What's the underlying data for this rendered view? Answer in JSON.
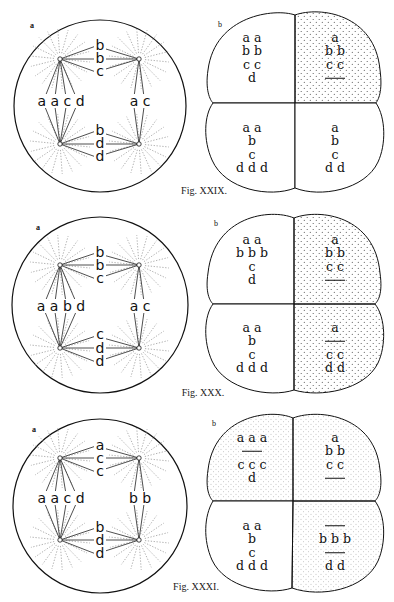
{
  "figures": [
    {
      "caption": "Fig. XXIX.",
      "panel_a": {
        "label": "a",
        "top_chromosomes": [
          "b",
          "b",
          "c"
        ],
        "bottom_chromosomes": [
          "b",
          "d",
          "d"
        ],
        "left_chromosomes": "a a c d",
        "right_chromosomes": "a c"
      },
      "panel_b": {
        "label": "b",
        "cells": [
          {
            "position": "top-left",
            "shaded": false,
            "lines": [
              "a a",
              "b b",
              "c c",
              "d"
            ],
            "bars": []
          },
          {
            "position": "top-right",
            "shaded": true,
            "lines": [
              "a",
              "b b",
              "c c"
            ],
            "bars": [
              "after-3"
            ]
          },
          {
            "position": "bottom-left",
            "shaded": false,
            "lines": [
              "a a",
              "b",
              "c",
              "d d d"
            ],
            "bars": []
          },
          {
            "position": "bottom-right",
            "shaded": false,
            "lines": [
              "a",
              "b",
              "c",
              "d d"
            ],
            "bars": []
          }
        ]
      }
    },
    {
      "caption": "Fig. XXX.",
      "panel_a": {
        "label": "a",
        "top_chromosomes": [
          "b",
          "b",
          "c"
        ],
        "bottom_chromosomes": [
          "c",
          "d",
          "d"
        ],
        "left_chromosomes": "a a b d",
        "right_chromosomes": "a c"
      },
      "panel_b": {
        "label": "b",
        "cells": [
          {
            "position": "top-left",
            "shaded": false,
            "lines": [
              "a a",
              "b b b",
              "c",
              "d"
            ],
            "bars": []
          },
          {
            "position": "top-right",
            "shaded": true,
            "lines": [
              "a",
              "b b",
              "c c"
            ],
            "bars": [
              "after-3"
            ]
          },
          {
            "position": "bottom-left",
            "shaded": false,
            "lines": [
              "a a",
              "b",
              "c",
              "d d d"
            ],
            "bars": []
          },
          {
            "position": "bottom-right",
            "shaded": true,
            "lines": [
              "a",
              "c c",
              "d d"
            ],
            "bars": [
              "after-1"
            ]
          }
        ]
      }
    },
    {
      "caption": "Fig. XXXI.",
      "panel_a": {
        "label": "a",
        "top_chromosomes": [
          "a",
          "c",
          "c"
        ],
        "bottom_chromosomes": [
          "b",
          "d",
          "d"
        ],
        "left_chromosomes": "a a c d",
        "right_chromosomes": "b b"
      },
      "panel_b": {
        "label": "b",
        "cells": [
          {
            "position": "top-left",
            "shaded": true,
            "lines": [
              "a a a",
              "c c c",
              "d"
            ],
            "bars": [
              "after-1"
            ]
          },
          {
            "position": "top-right",
            "shaded": true,
            "lines": [
              "a",
              "b b",
              "c c"
            ],
            "bars": [
              "after-3"
            ]
          },
          {
            "position": "bottom-left",
            "shaded": false,
            "lines": [
              "a a",
              "b",
              "c",
              "d d d"
            ],
            "bars": []
          },
          {
            "position": "bottom-right",
            "shaded": true,
            "lines": [
              "b b b",
              "d d"
            ],
            "bars": [
              "before-1",
              "after-1"
            ]
          }
        ]
      }
    }
  ],
  "colors": {
    "ink": "#111111",
    "background": "#ffffff",
    "stipple": "#555555",
    "aster": "#9a9a9a"
  }
}
